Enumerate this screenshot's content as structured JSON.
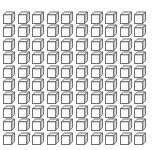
{
  "figure": {
    "rows": 10,
    "columns": 10,
    "total_units": 100,
    "unit_icon": "cube-icon",
    "colors": {
      "background": "#ffffff",
      "stroke": "#5a5a5a",
      "face_front": "#ffffff",
      "face_top": "#f2f2f2",
      "face_side": "#d9d9d9"
    }
  }
}
